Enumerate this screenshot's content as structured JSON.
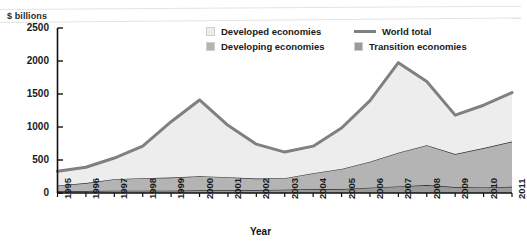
{
  "chart_data": {
    "type": "area",
    "stacked": true,
    "title": "",
    "subtitle": "",
    "unit_label": "$ billions",
    "xlabel": "Year",
    "ylabel": "$ billions",
    "categories": [
      "1995",
      "1996",
      "1997",
      "1998",
      "1999",
      "2000",
      "2001",
      "2002",
      "2003",
      "2004",
      "2005",
      "2006",
      "2007",
      "2008",
      "2009",
      "2010",
      "2011"
    ],
    "x": [
      1995,
      1996,
      1997,
      1998,
      1999,
      2000,
      2001,
      2002,
      2003,
      2004,
      2005,
      2006,
      2007,
      2008,
      2009,
      2010,
      2011
    ],
    "xlim": [
      1995,
      2011
    ],
    "ylim": [
      0,
      2500
    ],
    "yticks": [
      0,
      500,
      1000,
      1500,
      2000,
      2500
    ],
    "ytick_labels": [
      "0",
      "500",
      "1000",
      "1500",
      "2000",
      "2500"
    ],
    "grid": false,
    "legend_position": "top-right",
    "series": [
      {
        "name": "Transition economies",
        "kind": "area",
        "color": "#9a9a9a",
        "values": [
          30,
          30,
          35,
          35,
          35,
          40,
          40,
          45,
          50,
          60,
          60,
          80,
          100,
          120,
          90,
          85,
          95
        ]
      },
      {
        "name": "Developing economies",
        "kind": "area",
        "color": "#b4b4b4",
        "values": [
          85,
          120,
          175,
          190,
          200,
          215,
          200,
          175,
          175,
          240,
          305,
          395,
          510,
          605,
          500,
          595,
          685
        ]
      },
      {
        "name": "Developed economies",
        "kind": "area",
        "color": "#ededed",
        "values": [
          215,
          240,
          320,
          485,
          845,
          1155,
          785,
          520,
          395,
          410,
          620,
          925,
          1365,
          965,
          590,
          650,
          740
        ]
      },
      {
        "name": "World total",
        "kind": "line",
        "color": "#808080",
        "values": [
          330,
          390,
          530,
          710,
          1080,
          1410,
          1025,
          740,
          620,
          710,
          985,
          1400,
          1975,
          1690,
          1180,
          1330,
          1520
        ]
      }
    ],
    "legend_entries": [
      {
        "label": "Developed economies",
        "swatch": "#ededed",
        "type": "area"
      },
      {
        "label": "Developing economies",
        "swatch": "#b4b4b4",
        "type": "area"
      },
      {
        "label": "World total",
        "swatch": "#808080",
        "type": "line"
      },
      {
        "label": "Transition economies",
        "swatch": "#9a9a9a",
        "type": "area"
      }
    ]
  },
  "axis": {
    "x_title": "Year",
    "y_unit": "$ billions"
  }
}
